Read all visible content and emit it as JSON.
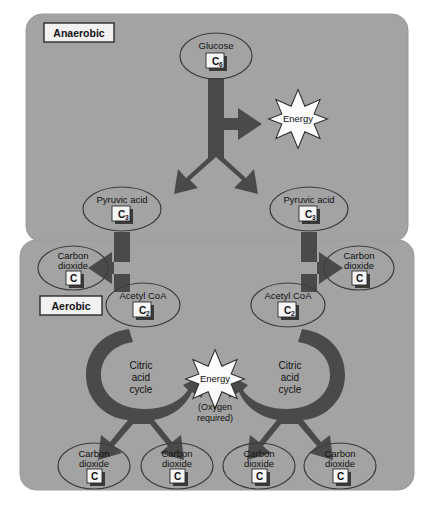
{
  "figure": {
    "colors": {
      "page_background": "#ffffff",
      "panel_fill": "#a3a3a3",
      "panel_stroke": "#9a9a9a",
      "arrow_fill": "#4a4a4a",
      "arrow_shadow": "#3a3a3a",
      "ellipse_stroke": "#3c3c3c",
      "label_box_fill": "#f2f2f2",
      "label_box_stroke": "#2b2b2b",
      "starburst_fill": "#fbfbfb",
      "starburst_stroke": "#2b2b2b",
      "text": "#111111"
    }
  },
  "phases": {
    "anaerobic": {
      "label": "Anaerobic"
    },
    "aerobic": {
      "label": "Aerobic"
    }
  },
  "nodes": {
    "glucose": {
      "name": "Glucose",
      "carbon": "C",
      "carbon_subscript": "6"
    },
    "pyruvic_left": {
      "name": "Pyruvic acid",
      "carbon": "C",
      "carbon_subscript": "3"
    },
    "pyruvic_right": {
      "name": "Pyruvic acid",
      "carbon": "C",
      "carbon_subscript": "3"
    },
    "acetyl_left": {
      "name": "Acetyl CoA",
      "carbon": "C",
      "carbon_subscript": "2"
    },
    "acetyl_right": {
      "name": "Acetyl CoA",
      "carbon": "C",
      "carbon_subscript": "2"
    },
    "co2_upper_left": {
      "line1": "Carbon",
      "line2": "dioxide",
      "carbon": "C",
      "carbon_subscript": ""
    },
    "co2_upper_right": {
      "line1": "Carbon",
      "line2": "dioxide",
      "carbon": "C",
      "carbon_subscript": ""
    },
    "co2_bottom_1": {
      "line1": "Carbon",
      "line2": "dioxide",
      "carbon": "C",
      "carbon_subscript": ""
    },
    "co2_bottom_2": {
      "line1": "Carbon",
      "line2": "dioxide",
      "carbon": "C",
      "carbon_subscript": ""
    },
    "co2_bottom_3": {
      "line1": "Carbon",
      "line2": "dioxide",
      "carbon": "C",
      "carbon_subscript": ""
    },
    "co2_bottom_4": {
      "line1": "Carbon",
      "line2": "dioxide",
      "carbon": "C",
      "carbon_subscript": ""
    }
  },
  "cycles": {
    "citric_left": {
      "line1": "Citric",
      "line2": "acid",
      "line3": "cycle"
    },
    "citric_right": {
      "line1": "Citric",
      "line2": "acid",
      "line3": "cycle"
    }
  },
  "energy": {
    "anaerobic_burst": {
      "label": "Energy"
    },
    "aerobic_burst": {
      "label": "Energy",
      "note_line1": "(Oxygen",
      "note_line2": "required)"
    }
  }
}
